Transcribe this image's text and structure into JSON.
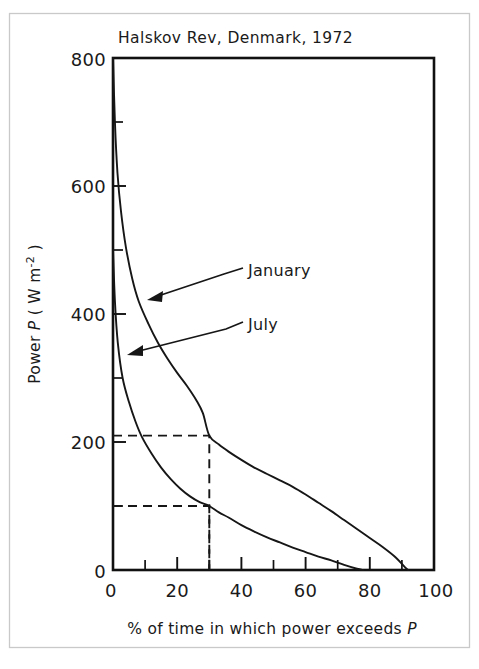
{
  "chart_data": {
    "type": "line",
    "title": "Halskov Rev, Denmark, 1972",
    "xlabel": "% of time in which power exceeds P",
    "ylabel": "Power P ( W m⁻² )",
    "ylabel_parts": {
      "prefix": "Power ",
      "symbol": "P",
      "units_open": " ( W m",
      "exponent": "-2",
      "units_close": " )"
    },
    "xlabel_parts": {
      "text": "% of time in which power exceeds ",
      "symbol": "P"
    },
    "xlim": [
      0,
      100
    ],
    "ylim": [
      0,
      800
    ],
    "grid": false,
    "legend_position": "inline-annotations",
    "x_ticks_major": [
      0,
      20,
      40,
      60,
      80,
      100
    ],
    "x_tick_labels": [
      "0",
      "20",
      "40",
      "60",
      "80",
      "100"
    ],
    "x_ticks_minor": [
      10,
      30,
      50,
      70,
      90
    ],
    "y_ticks_major": [
      0,
      200,
      400,
      600,
      800
    ],
    "y_tick_labels": [
      "0",
      "200",
      "400",
      "600",
      "800"
    ],
    "y_ticks_minor": [
      100,
      300,
      500,
      700
    ],
    "series": [
      {
        "name": "January",
        "label": "January",
        "x": [
          0,
          0.6,
          1.4,
          2.5,
          4,
          6,
          8,
          11,
          14,
          17,
          20,
          23,
          26,
          28,
          30,
          33,
          36,
          40,
          44,
          48,
          52,
          56,
          60,
          64,
          68,
          72,
          76,
          80,
          84,
          88,
          91,
          92
        ],
        "y": [
          800,
          700,
          620,
          560,
          505,
          455,
          420,
          385,
          355,
          330,
          308,
          288,
          265,
          245,
          210,
          196,
          185,
          172,
          160,
          150,
          140,
          130,
          118,
          105,
          92,
          78,
          64,
          50,
          36,
          20,
          4,
          0
        ]
      },
      {
        "name": "July",
        "label": "July",
        "x": [
          0,
          0.6,
          1.5,
          3,
          5,
          7,
          9,
          12,
          15,
          18,
          21,
          24,
          27,
          30,
          33,
          36,
          40,
          44,
          48,
          52,
          56,
          60,
          64,
          68,
          72,
          76,
          78
        ],
        "y": [
          500,
          420,
          355,
          300,
          262,
          232,
          208,
          182,
          160,
          142,
          127,
          115,
          106,
          100,
          90,
          82,
          70,
          60,
          51,
          43,
          35,
          28,
          21,
          15,
          8,
          2,
          0
        ]
      }
    ],
    "annotations": [
      {
        "name": "january-callout",
        "label": "January",
        "points_to": {
          "x": 11,
          "y": 385
        }
      },
      {
        "name": "july-callout",
        "label": "July",
        "points_to": {
          "x": 5,
          "y": 262
        }
      }
    ],
    "guide_lines": [
      {
        "name": "january-readout",
        "x": 30,
        "y": 210,
        "style": "dashed",
        "description": "horizontal from y-axis to curve, vertical down to x-axis"
      },
      {
        "name": "july-readout",
        "x": 30,
        "y": 100,
        "style": "dashed",
        "description": "horizontal from y-axis to curve, vertical down to x-axis"
      }
    ],
    "colors": {
      "ink": "#161616",
      "frame": "#111111",
      "background": "#ffffff",
      "outer_border": "#c9c9c9"
    }
  }
}
